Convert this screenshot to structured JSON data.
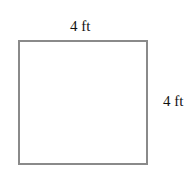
{
  "diagram": {
    "shape": "square",
    "top_side_label": "4 ft",
    "right_side_label": "4 ft",
    "stroke_color": "#8a8a8a"
  }
}
